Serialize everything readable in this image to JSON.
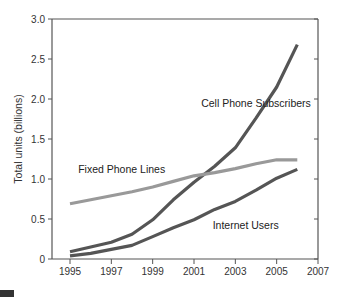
{
  "chart_data": {
    "type": "line",
    "title": "",
    "xlabel": "",
    "ylabel": "Total units (billions)",
    "xlim": [
      1995,
      2007
    ],
    "ylim": [
      0,
      3.0
    ],
    "x_ticks": [
      "1995",
      "1997",
      "1999",
      "2001",
      "2003",
      "2005",
      "2007"
    ],
    "y_ticks": [
      "0",
      "0.5",
      "1.0",
      "1.5",
      "2.0",
      "2.5",
      "3.0"
    ],
    "grid": false,
    "legend": "inline labels",
    "x": [
      1995,
      1996,
      1997,
      1998,
      1999,
      2000,
      2001,
      2002,
      2003,
      2004,
      2005,
      2006
    ],
    "series": [
      {
        "name": "Cell Phone Subscribers",
        "color": "#555555",
        "values": [
          0.09,
          0.15,
          0.21,
          0.31,
          0.49,
          0.74,
          0.96,
          1.16,
          1.39,
          1.76,
          2.15,
          2.68
        ]
      },
      {
        "name": "Fixed Phone Lines",
        "color": "#999999",
        "values": [
          0.69,
          0.74,
          0.79,
          0.84,
          0.9,
          0.97,
          1.04,
          1.08,
          1.13,
          1.19,
          1.24,
          1.24
        ]
      },
      {
        "name": "Internet Users",
        "color": "#555555",
        "values": [
          0.04,
          0.07,
          0.12,
          0.17,
          0.28,
          0.39,
          0.49,
          0.62,
          0.72,
          0.86,
          1.01,
          1.12
        ]
      }
    ],
    "annotations": [
      {
        "text": "Cell Phone Subscribers",
        "x": 2004.0,
        "y": 1.9
      },
      {
        "text": "Fixed Phone Lines",
        "x": 1997.5,
        "y": 1.08
      },
      {
        "text": "Internet Users",
        "x": 2003.5,
        "y": 0.38
      }
    ]
  }
}
